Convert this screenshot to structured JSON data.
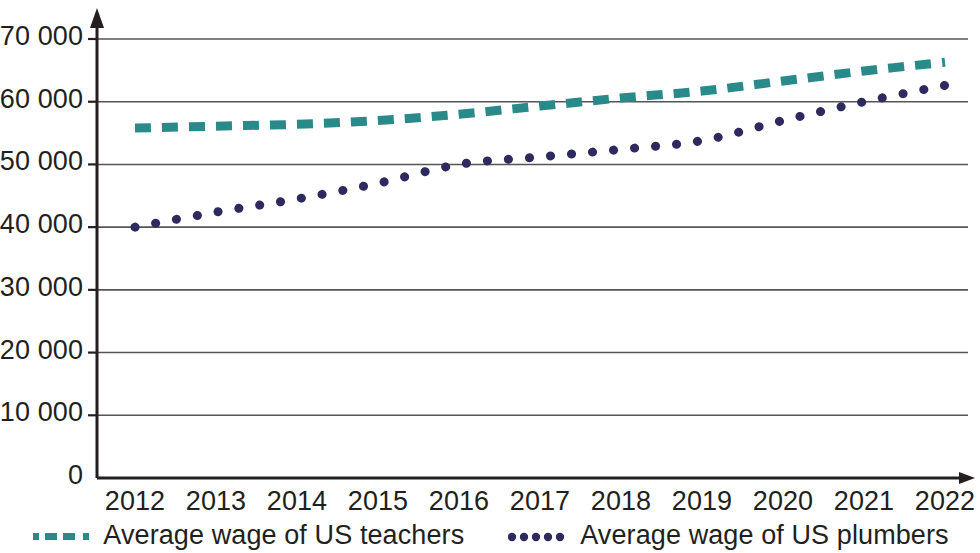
{
  "chart_data": {
    "type": "line",
    "title": "",
    "subtitle": "",
    "xlabel": "",
    "ylabel": "",
    "grid": true,
    "legend_position": "bottom",
    "x": [
      2012,
      2013,
      2014,
      2015,
      2016,
      2017,
      2018,
      2019,
      2020,
      2021,
      2022
    ],
    "categories": [
      "2012",
      "2013",
      "2014",
      "2015",
      "2016",
      "2017",
      "2018",
      "2019",
      "2020",
      "2021",
      "2022"
    ],
    "xlim": [
      2012,
      2022
    ],
    "ylim": [
      0,
      70000
    ],
    "ytick_values": [
      0,
      10000,
      20000,
      30000,
      40000,
      50000,
      60000,
      70000
    ],
    "ytick_labels": [
      "0",
      "10 000",
      "20 000",
      "30 000",
      "40 000",
      "50 000",
      "60 000",
      "70 000"
    ],
    "series": [
      {
        "name": "Average wage of US teachers",
        "color": "#2a8a8a",
        "style": "dashed",
        "values": [
          55800,
          56100,
          56400,
          57000,
          58000,
          59300,
          60600,
          61700,
          63300,
          64900,
          66300
        ]
      },
      {
        "name": "Average wage of US plumbers",
        "color": "#2e2a5e",
        "style": "dotted",
        "values": [
          40000,
          42400,
          44500,
          47000,
          50000,
          51200,
          52400,
          53800,
          57000,
          60000,
          62600
        ]
      }
    ]
  },
  "axes": {
    "y_axis_name": "y-axis",
    "x_axis_name": "x-axis",
    "gridline_color": "#555555",
    "axis_color": "#231f20"
  },
  "legend": {
    "items": [
      {
        "label": "Average wage of US teachers",
        "color": "#2a8a8a",
        "marker": "dashed-line-marker"
      },
      {
        "label": "Average wage of US plumbers",
        "color": "#2e2a5e",
        "marker": "dotted-line-marker"
      }
    ]
  }
}
